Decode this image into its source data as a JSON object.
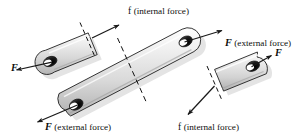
{
  "figure": {
    "background_color": "#ffffff",
    "line_color": "#111111",
    "body_fill_light": "#f2f2f2",
    "body_fill_mid": "#d2d2d2",
    "body_fill_dark": "#a8a8a8",
    "hole_dark": "#161616",
    "hole_highlight": "#ffffff",
    "shadow_color": "#bdbdbd"
  },
  "labels": {
    "top_internal": {
      "symbol": "f",
      "text": "(internal force)",
      "full": "f (internal force)"
    },
    "right_external": {
      "symbol": "F",
      "text": "(external force)",
      "full": "F (external force)"
    },
    "bottom_external": {
      "symbol": "F",
      "text": "(external force)",
      "full": "F (external force)"
    },
    "bottom_internal": {
      "symbol": "f",
      "text": "(internal force)",
      "full": "f (internal force)"
    },
    "left_force": {
      "symbol": "F"
    },
    "upper_right_force": {
      "symbol": "F"
    }
  },
  "parts": [
    {
      "name": "upper-left-link-segment",
      "description": "short link segment, rounded left end with pin hole, cut at dashed section line on the right",
      "forces": [
        "F external at pin, pointing down-left",
        "f internal at cut, pointing up-right"
      ]
    },
    {
      "name": "central-long-link",
      "description": "long diagonal link with pin holes at both ends, dashed section line across its middle",
      "forces": [
        "F external at lower-left pin, pointing down-left",
        "F external at upper-right pin, pointing up-right"
      ]
    },
    {
      "name": "lower-right-link-segment",
      "description": "short link segment, rounded right end with pin hole, cut at dashed section line on the left",
      "forces": [
        "f internal at cut, pointing down-left",
        "F external at pin, pointing up-right"
      ]
    }
  ]
}
